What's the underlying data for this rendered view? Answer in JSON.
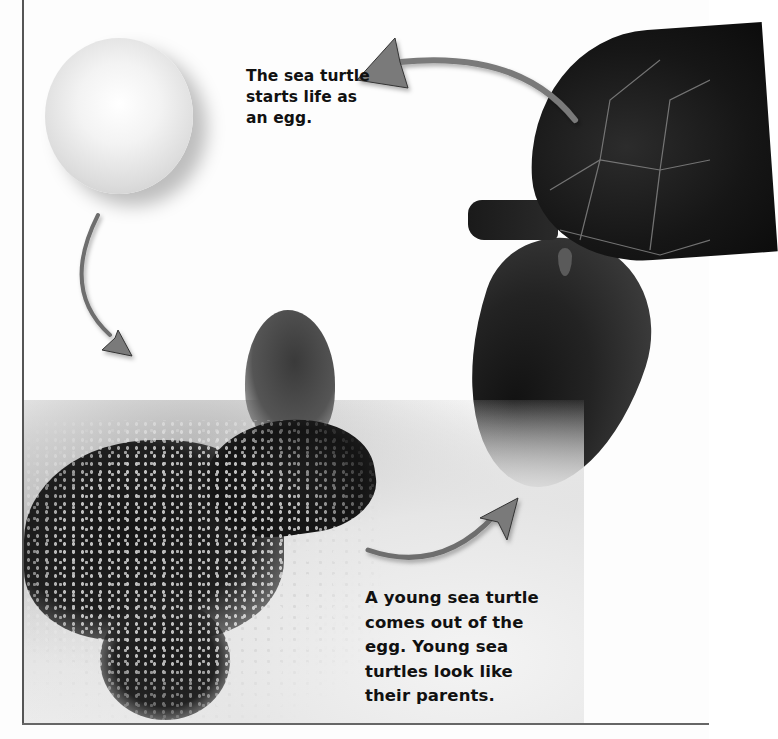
{
  "page": {
    "topic": "sea turtle life cycle",
    "background_color": "#fdfdfd",
    "frame_color": "#555555"
  },
  "captions": {
    "egg": {
      "lines": [
        "The sea turtle",
        "starts life as",
        "an egg."
      ]
    },
    "young": {
      "lines": [
        "A young sea turtle",
        "comes out of the",
        "egg. Young sea",
        "turtles look like",
        "their parents."
      ]
    }
  },
  "images": {
    "egg": {
      "label": "sea turtle egg"
    },
    "hatchling": {
      "label": "young sea turtle in sand"
    },
    "adult": {
      "label": "adult sea turtle"
    }
  },
  "arrows": [
    {
      "name": "adult-to-egg-arrow",
      "direction": "left",
      "color": "#7a7a7a"
    },
    {
      "name": "egg-to-hatchling-arrow",
      "direction": "down",
      "color": "#7a7a7a"
    },
    {
      "name": "hatchling-to-adult-arrow",
      "direction": "right",
      "color": "#7a7a7a"
    }
  ]
}
